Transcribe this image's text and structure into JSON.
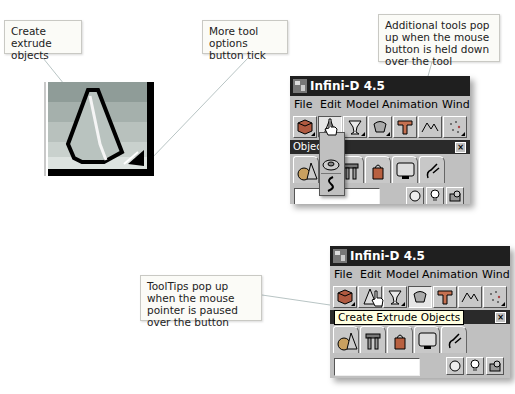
{
  "callouts": {
    "create_extrude": "Create extrude objects",
    "more_tool_options": "More tool options button tick",
    "additional_tools": "Additional tools pop up when the mouse button is held down over the tool",
    "tooltips": "ToolTips pop up when the mouse pointer is paused over the button"
  },
  "windows": [
    {
      "title": "Infini-D 4.5",
      "menu": [
        "File",
        "Edit",
        "Model",
        "Animation",
        "Wind"
      ],
      "toolbar_icons": [
        "cube-icon",
        "extrude-cone-icon",
        "lathe-goblet-icon",
        "terrain-icon",
        "extrude-t-icon",
        "mountain-icon",
        "particles-icon"
      ],
      "subpanel_title": "Objec",
      "popup_tools": [
        "extrude-cone-icon",
        "torus-icon",
        "spring-icon"
      ]
    },
    {
      "title": "Infini-D 4.5",
      "menu": [
        "File",
        "Edit",
        "Model",
        "Animation",
        "Wind"
      ],
      "toolbar_icons": [
        "cube-icon",
        "extrude-cone-icon",
        "lathe-goblet-icon",
        "terrain-icon",
        "extrude-t-icon",
        "mountain-icon",
        "particles-icon"
      ],
      "tooltip": "Create Extrude Objects"
    }
  ],
  "palette_tabs": [
    "primitives-icon",
    "tools-icon",
    "teapot-icon",
    "monitor-icon",
    "plug-icon"
  ],
  "bottom_buttons": [
    "light-bulb-circle-icon",
    "light-bulb-icon",
    "camera-icon"
  ]
}
